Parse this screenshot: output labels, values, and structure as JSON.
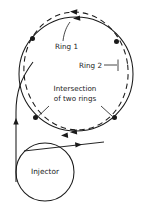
{
  "diagram": {
    "background_color": "#ffffff",
    "line_color": "#1a1a1a",
    "labels": {
      "ring1": "Ring 1",
      "ring2": "Ring 2",
      "intersection_line1": "Intersection",
      "intersection_line2": "of two rings",
      "injector": "Injector"
    },
    "elements": {
      "ring1_style": "solid",
      "ring2_style": "dashed",
      "injector_style": "solid",
      "intersection_point_count": 4,
      "arrow_direction": "clockwise"
    }
  }
}
